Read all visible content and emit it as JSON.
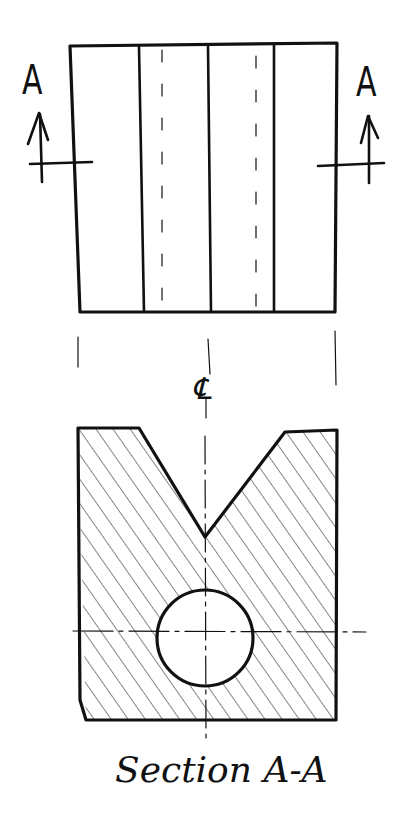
{
  "diagram": {
    "type": "engineering-drawing",
    "views": [
      {
        "name": "front-view",
        "description": "Rectangular elevation with vertical lines showing V-groove edges and hidden hole lines"
      },
      {
        "name": "section-view",
        "description": "Hatched cross-section with V-notch on top and circular through-hole"
      }
    ],
    "cutting_plane": {
      "left_label": "A",
      "right_label": "A",
      "arrow_direction": "up"
    },
    "centerline_symbol": "℄",
    "caption": "Section A-A",
    "colors": {
      "ink": "#111111",
      "background": "#ffffff"
    }
  }
}
